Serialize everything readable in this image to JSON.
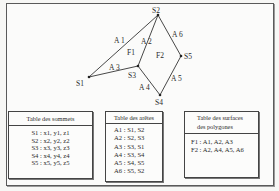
{
  "graph": {
    "vertices": [
      {
        "id": "S1",
        "label": "S1",
        "x": 89,
        "y": 77,
        "label_x": 76,
        "label_y": 86
      },
      {
        "id": "S2",
        "label": "S2",
        "x": 158,
        "y": 15,
        "label_x": 152,
        "label_y": 13
      },
      {
        "id": "S3",
        "label": "S3",
        "x": 138,
        "y": 66,
        "label_x": 128,
        "label_y": 78
      },
      {
        "id": "S4",
        "label": "S4",
        "x": 160,
        "y": 95,
        "label_x": 155,
        "label_y": 105
      },
      {
        "id": "S5",
        "label": "S5",
        "x": 181,
        "y": 56,
        "label_x": 184,
        "label_y": 59
      }
    ],
    "edges": [
      {
        "id": "A1",
        "label": "A 1",
        "from": "S1",
        "to": "S2",
        "label_x": 114,
        "label_y": 43
      },
      {
        "id": "A2",
        "label": "A 2",
        "from": "S2",
        "to": "S3",
        "label_x": 141,
        "label_y": 44
      },
      {
        "id": "A3",
        "label": "A 3",
        "from": "S3",
        "to": "S1",
        "label_x": 109,
        "label_y": 70
      },
      {
        "id": "A4",
        "label": "A 4",
        "from": "S3",
        "to": "S4",
        "label_x": 139,
        "label_y": 90
      },
      {
        "id": "A5",
        "label": "A 5",
        "from": "S4",
        "to": "S5",
        "label_x": 171,
        "label_y": 81
      },
      {
        "id": "A6",
        "label": "A 6",
        "from": "S5",
        "to": "S2",
        "label_x": 172,
        "label_y": 37
      }
    ],
    "faces": [
      {
        "id": "F1",
        "label": "F1",
        "x": 127,
        "y": 55
      },
      {
        "id": "F2",
        "label": "F2",
        "x": 156,
        "y": 58
      }
    ]
  },
  "tables": {
    "sommets": {
      "title": "Table des sommets",
      "rows": [
        "S1 : x1, y1, z1",
        "S2 : x2, y2, z2",
        "S3 : x3, y3, z3",
        "S4 : x4, y4, z4",
        "S5 : x5, y5, z5"
      ]
    },
    "aretes": {
      "title": "Table des arêtes",
      "rows": [
        "A1 : S1, S2",
        "A2 : S2, S3",
        "A3 : S3, S1",
        "A4 : S3, S4",
        "A5 : S4, S5",
        "A6 : S5, S2"
      ]
    },
    "surfaces": {
      "title_line1": "Table des surfaces",
      "title_line2": "des polygones",
      "rows": [
        "F1 : A1, A2, A3",
        "F2 : A2, A4, A5, A6"
      ]
    }
  }
}
